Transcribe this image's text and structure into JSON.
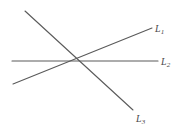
{
  "figure": {
    "background_color": "#ffffff",
    "stroke_color": "#5a5a5a",
    "label_color": "#4a4a4a",
    "width": 182,
    "height": 135,
    "intersection_point": {
      "x": 77,
      "y": 61
    }
  },
  "lines": [
    {
      "id": "L1",
      "label_letter": "L",
      "label_subscript": "1",
      "description": "ascending line from lower-left to upper-right",
      "x1": 13,
      "y1": 84,
      "x2": 152,
      "y2": 28,
      "stroke_width": 1.1
    },
    {
      "id": "L2",
      "label_letter": "L",
      "label_subscript": "2",
      "description": "horizontal line",
      "x1": 12,
      "y1": 61,
      "x2": 158,
      "y2": 61,
      "stroke_width": 1.1
    },
    {
      "id": "L3",
      "label_letter": "L",
      "label_subscript": "3",
      "description": "descending line from upper-left to lower-right",
      "x1": 25,
      "y1": 11,
      "x2": 133,
      "y2": 110,
      "stroke_width": 1.1
    }
  ]
}
